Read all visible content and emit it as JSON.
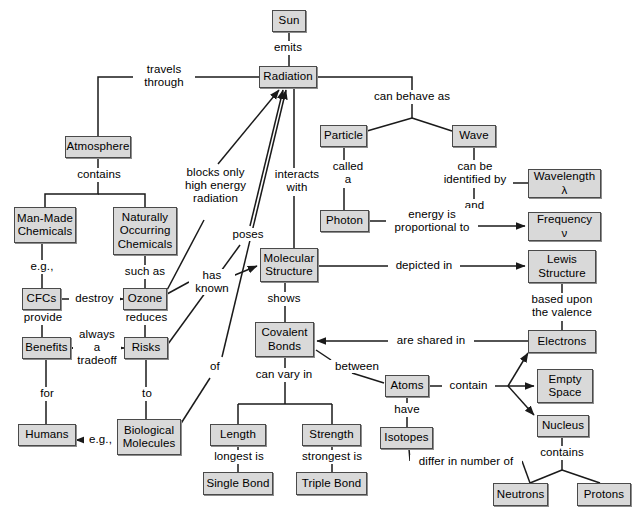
{
  "diagram": {
    "style": {
      "node_fill": "#d9d9d9",
      "node_border": "#4a4a4a",
      "edge_color": "#1a1a1a",
      "background": "#ffffff",
      "text_color": "#000000"
    },
    "nodes": [
      {
        "id": "sun",
        "label": "Sun",
        "x": 272,
        "y": 10,
        "w": 34,
        "h": 22
      },
      {
        "id": "radiation",
        "label": "Radiation",
        "x": 259,
        "y": 66,
        "w": 58,
        "h": 22
      },
      {
        "id": "atmosphere",
        "label": "Atmosphere",
        "x": 65,
        "y": 136,
        "w": 66,
        "h": 22
      },
      {
        "id": "manmade",
        "label": "Man-Made\nChemicals",
        "x": 14,
        "y": 207,
        "w": 62,
        "h": 36
      },
      {
        "id": "natural",
        "label": "Naturally\nOccurring\nChemicals",
        "x": 113,
        "y": 207,
        "w": 64,
        "h": 48
      },
      {
        "id": "cfcs",
        "label": "CFCs",
        "x": 22,
        "y": 288,
        "w": 39,
        "h": 22
      },
      {
        "id": "ozone",
        "label": "Ozone",
        "x": 123,
        "y": 288,
        "w": 44,
        "h": 22
      },
      {
        "id": "benefits",
        "label": "Benefits",
        "x": 22,
        "y": 337,
        "w": 49,
        "h": 22
      },
      {
        "id": "risks",
        "label": "Risks",
        "x": 124,
        "y": 337,
        "w": 44,
        "h": 22
      },
      {
        "id": "humans",
        "label": "Humans",
        "x": 18,
        "y": 424,
        "w": 58,
        "h": 22
      },
      {
        "id": "biomol",
        "label": "Biological\nMolecules",
        "x": 117,
        "y": 419,
        "w": 64,
        "h": 36
      },
      {
        "id": "particle",
        "label": "Particle",
        "x": 320,
        "y": 125,
        "w": 47,
        "h": 22
      },
      {
        "id": "wave",
        "label": "Wave",
        "x": 452,
        "y": 125,
        "w": 44,
        "h": 22
      },
      {
        "id": "photon",
        "label": "Photon",
        "x": 320,
        "y": 210,
        "w": 49,
        "h": 22
      },
      {
        "id": "wavelength",
        "label": "Wavelength\nλ",
        "x": 528,
        "y": 169,
        "w": 73,
        "h": 29
      },
      {
        "id": "frequency",
        "label": "Frequency\nν",
        "x": 528,
        "y": 212,
        "w": 73,
        "h": 29
      },
      {
        "id": "molstruct",
        "label": "Molecular\nStructure",
        "x": 260,
        "y": 248,
        "w": 58,
        "h": 34
      },
      {
        "id": "lewis",
        "label": "Lewis\nStructure",
        "x": 528,
        "y": 250,
        "w": 68,
        "h": 33
      },
      {
        "id": "covalent",
        "label": "Covalent\nBonds",
        "x": 255,
        "y": 322,
        "w": 59,
        "h": 35
      },
      {
        "id": "electrons",
        "label": "Electrons",
        "x": 528,
        "y": 330,
        "w": 68,
        "h": 23
      },
      {
        "id": "length",
        "label": "Length",
        "x": 210,
        "y": 424,
        "w": 56,
        "h": 22
      },
      {
        "id": "strength",
        "label": "Strength",
        "x": 302,
        "y": 424,
        "w": 59,
        "h": 22
      },
      {
        "id": "singlebond",
        "label": "Single Bond",
        "x": 203,
        "y": 472,
        "w": 70,
        "h": 23
      },
      {
        "id": "triplebond",
        "label": "Triple Bond",
        "x": 296,
        "y": 472,
        "w": 71,
        "h": 23
      },
      {
        "id": "atoms",
        "label": "Atoms",
        "x": 385,
        "y": 375,
        "w": 44,
        "h": 22
      },
      {
        "id": "isotopes",
        "label": "Isotopes",
        "x": 380,
        "y": 427,
        "w": 53,
        "h": 22
      },
      {
        "id": "emptyspace",
        "label": "Empty\nSpace",
        "x": 537,
        "y": 369,
        "w": 56,
        "h": 34
      },
      {
        "id": "nucleus",
        "label": "Nucleus",
        "x": 537,
        "y": 415,
        "w": 52,
        "h": 22
      },
      {
        "id": "neutrons",
        "label": "Neutrons",
        "x": 493,
        "y": 483,
        "w": 55,
        "h": 23
      },
      {
        "id": "protons",
        "label": "Protons",
        "x": 577,
        "y": 483,
        "w": 54,
        "h": 23
      }
    ],
    "edge_labels": [
      {
        "id": "emits",
        "text": "emits",
        "x": 263,
        "y": 41,
        "w": 50
      },
      {
        "id": "travels",
        "text": "travels\nthrough",
        "x": 133,
        "y": 66,
        "w": 62
      },
      {
        "id": "contains1",
        "text": "contains",
        "x": 70,
        "y": 168,
        "w": 58
      },
      {
        "id": "eg1",
        "text": "e.g.,",
        "x": 23,
        "y": 260,
        "w": 38
      },
      {
        "id": "suchas",
        "text": "such as",
        "x": 118,
        "y": 265,
        "w": 54
      },
      {
        "id": "destroy",
        "text": "destroy",
        "x": 69,
        "y": 292,
        "w": 51
      },
      {
        "id": "provide",
        "text": "provide",
        "x": 16,
        "y": 311,
        "w": 54
      },
      {
        "id": "reduces",
        "text": "reduces",
        "x": 119,
        "y": 311,
        "w": 55
      },
      {
        "id": "tradeoff",
        "text": "always\na\ntradeoff",
        "x": 73,
        "y": 328,
        "w": 48
      },
      {
        "id": "for",
        "text": "for",
        "x": 34,
        "y": 387,
        "w": 26
      },
      {
        "id": "to",
        "text": "to",
        "x": 137,
        "y": 387,
        "w": 20
      },
      {
        "id": "eg2",
        "text": "e.g.,",
        "x": 84,
        "y": 430,
        "w": 33
      },
      {
        "id": "blocks",
        "text": "blocks only\nhigh energy\nradiation",
        "x": 178,
        "y": 166,
        "w": 75
      },
      {
        "id": "poses",
        "text": "poses",
        "x": 227,
        "y": 228,
        "w": 42
      },
      {
        "id": "interacts",
        "text": "interacts\nwith",
        "x": 269,
        "y": 168,
        "w": 56
      },
      {
        "id": "hasknown",
        "text": "has\nknown",
        "x": 189,
        "y": 269,
        "w": 46
      },
      {
        "id": "of",
        "text": "of",
        "x": 206,
        "y": 360,
        "w": 18
      },
      {
        "id": "canbehave",
        "text": "can behave as",
        "x": 366,
        "y": 90,
        "w": 92
      },
      {
        "id": "calleda",
        "text": "called\na",
        "x": 327,
        "y": 160,
        "w": 42
      },
      {
        "id": "canbeident",
        "text": "can be\nidentified by",
        "x": 437,
        "y": 160,
        "w": 76
      },
      {
        "id": "and",
        "text": "and",
        "x": 460,
        "y": 199,
        "w": 29
      },
      {
        "id": "energyprop",
        "text": "energy is\nproportional to",
        "x": 386,
        "y": 208,
        "w": 92
      },
      {
        "id": "depictedin",
        "text": "depicted in",
        "x": 388,
        "y": 257,
        "w": 72
      },
      {
        "id": "basedupon",
        "text": "based upon\nthe valence",
        "x": 523,
        "y": 293,
        "w": 78
      },
      {
        "id": "shows",
        "text": "shows",
        "x": 261,
        "y": 292,
        "w": 46
      },
      {
        "id": "aresharedin",
        "text": "are shared in",
        "x": 388,
        "y": 330,
        "w": 86
      },
      {
        "id": "canvaryin",
        "text": "can vary in",
        "x": 249,
        "y": 368,
        "w": 70
      },
      {
        "id": "between",
        "text": "between",
        "x": 329,
        "y": 360,
        "w": 56
      },
      {
        "id": "contain",
        "text": "contain",
        "x": 442,
        "y": 377,
        "w": 53
      },
      {
        "id": "have",
        "text": "have",
        "x": 388,
        "y": 403,
        "w": 38
      },
      {
        "id": "longestis",
        "text": "longest is",
        "x": 208,
        "y": 450,
        "w": 62
      },
      {
        "id": "strongestis",
        "text": "strongest is",
        "x": 296,
        "y": 450,
        "w": 72
      },
      {
        "id": "differnumber",
        "text": "differ in number of",
        "x": 410,
        "y": 455,
        "w": 112
      },
      {
        "id": "contains2",
        "text": "contains",
        "x": 533,
        "y": 446,
        "w": 58
      }
    ],
    "relationships": [
      {
        "from": "sun",
        "to": "radiation",
        "label": "emits"
      },
      {
        "from": "radiation",
        "to": "atmosphere",
        "label": "travels through"
      },
      {
        "from": "atmosphere",
        "to": "manmade",
        "label": "contains"
      },
      {
        "from": "atmosphere",
        "to": "natural",
        "label": "contains"
      },
      {
        "from": "manmade",
        "to": "cfcs",
        "label": "e.g.,"
      },
      {
        "from": "natural",
        "to": "ozone",
        "label": "such as"
      },
      {
        "from": "cfcs",
        "to": "ozone",
        "label": "destroy"
      },
      {
        "from": "cfcs",
        "to": "benefits",
        "label": "provide"
      },
      {
        "from": "ozone",
        "to": "risks",
        "label": "reduces"
      },
      {
        "from": "benefits",
        "to": "risks",
        "label": "always a tradeoff"
      },
      {
        "from": "benefits",
        "to": "humans",
        "label": "for"
      },
      {
        "from": "risks",
        "to": "biomol",
        "label": "to"
      },
      {
        "from": "biomol",
        "to": "humans",
        "label": "e.g.,"
      },
      {
        "from": "ozone",
        "to": "radiation",
        "label": "blocks only high energy radiation"
      },
      {
        "from": "risks",
        "to": "radiation",
        "label": "poses"
      },
      {
        "from": "biomol",
        "to": "radiation",
        "label": "of"
      },
      {
        "from": "radiation",
        "to": "molstruct",
        "label": "interacts with"
      },
      {
        "from": "ozone",
        "to": "molstruct",
        "label": "has known"
      },
      {
        "from": "radiation",
        "to": "particle",
        "label": "can behave as"
      },
      {
        "from": "radiation",
        "to": "wave",
        "label": "can behave as"
      },
      {
        "from": "particle",
        "to": "photon",
        "label": "called a"
      },
      {
        "from": "wave",
        "to": "wavelength",
        "label": "can be identified by"
      },
      {
        "from": "wave",
        "to": "frequency",
        "label": "and"
      },
      {
        "from": "photon",
        "to": "frequency",
        "label": "energy is proportional to"
      },
      {
        "from": "molstruct",
        "to": "lewis",
        "label": "depicted in"
      },
      {
        "from": "lewis",
        "to": "electrons",
        "label": "based upon the valence"
      },
      {
        "from": "molstruct",
        "to": "covalent",
        "label": "shows"
      },
      {
        "from": "electrons",
        "to": "covalent",
        "label": "are shared in"
      },
      {
        "from": "covalent",
        "to": "length",
        "label": "can vary in"
      },
      {
        "from": "covalent",
        "to": "strength",
        "label": "can vary in"
      },
      {
        "from": "covalent",
        "to": "atoms",
        "label": "between"
      },
      {
        "from": "length",
        "to": "singlebond",
        "label": "longest is"
      },
      {
        "from": "strength",
        "to": "triplebond",
        "label": "strongest is"
      },
      {
        "from": "atoms",
        "to": "electrons",
        "label": "contain"
      },
      {
        "from": "atoms",
        "to": "emptyspace",
        "label": "contain"
      },
      {
        "from": "atoms",
        "to": "nucleus",
        "label": "contain"
      },
      {
        "from": "atoms",
        "to": "isotopes",
        "label": "have"
      },
      {
        "from": "isotopes",
        "to": "neutrons",
        "label": "differ in number of"
      },
      {
        "from": "nucleus",
        "to": "neutrons",
        "label": "contains"
      },
      {
        "from": "nucleus",
        "to": "protons",
        "label": "contains"
      }
    ]
  }
}
